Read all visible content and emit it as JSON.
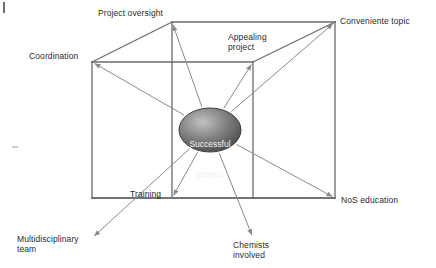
{
  "figure": {
    "type": "cube-diagram",
    "center_node": {
      "label": "Successful project",
      "line1": "Successful",
      "line2": "project",
      "shape": "ellipse",
      "fill_colors": [
        "#b9b9b9",
        "#6f6f6f",
        "#4a4a4a"
      ],
      "text_color": "#f2f2f2",
      "cx": 210,
      "cy": 130,
      "rx": 31,
      "ry": 22
    },
    "line_color": "#6b6b6b",
    "arrow_color": "#8a8a8a",
    "corner_nodes": [
      {
        "id": "project-oversight",
        "label": "Project oversight",
        "lines": [
          "Project oversight"
        ],
        "corner_x": 172,
        "corner_y": 22,
        "label_x": 98,
        "label_y": 8
      },
      {
        "id": "conveniente-topic",
        "label": "Conveniente topic",
        "lines": [
          "Conveniente topic"
        ],
        "corner_x": 335,
        "corner_y": 22,
        "label_x": 340,
        "label_y": 16
      },
      {
        "id": "coordination",
        "label": "Coordination",
        "lines": [
          "Coordination"
        ],
        "corner_x": 92,
        "corner_y": 62,
        "label_x": 29,
        "label_y": 51
      },
      {
        "id": "appealing-project",
        "label": "Appealing project",
        "lines": [
          "Appealing",
          "project"
        ],
        "corner_x": 253,
        "corner_y": 62,
        "label_x": 228,
        "label_y": 32
      },
      {
        "id": "training",
        "label": "Training",
        "lines": [
          "Training"
        ],
        "corner_x": 172,
        "corner_y": 198,
        "label_x": 130,
        "label_y": 189
      },
      {
        "id": "nos-education",
        "label": "NoS education",
        "lines": [
          "NoS education"
        ],
        "corner_x": 335,
        "corner_y": 198,
        "label_x": 341,
        "label_y": 195
      },
      {
        "id": "multidisciplinary-team",
        "label": "Multidisciplinary team",
        "lines": [
          "Multidisciplinary",
          "team"
        ],
        "corner_x": 92,
        "corner_y": 238,
        "label_x": 17,
        "label_y": 234
      },
      {
        "id": "chemists-involved",
        "label": "Chemists involved",
        "lines": [
          "Chemists",
          "involved"
        ],
        "corner_x": 253,
        "corner_y": 238,
        "label_x": 233,
        "label_y": 240
      }
    ],
    "cube_edges": [
      [
        92,
        62,
        253,
        62
      ],
      [
        253,
        62,
        253,
        198
      ],
      [
        253,
        198,
        92,
        198
      ],
      [
        92,
        198,
        92,
        62
      ],
      [
        172,
        22,
        335,
        22
      ],
      [
        335,
        22,
        335,
        198
      ],
      [
        335,
        198,
        172,
        198
      ],
      [
        172,
        198,
        172,
        22
      ],
      [
        92,
        62,
        172,
        22
      ],
      [
        253,
        62,
        335,
        22
      ],
      [
        253,
        198,
        335,
        198
      ],
      [
        92,
        198,
        172,
        198
      ]
    ]
  }
}
